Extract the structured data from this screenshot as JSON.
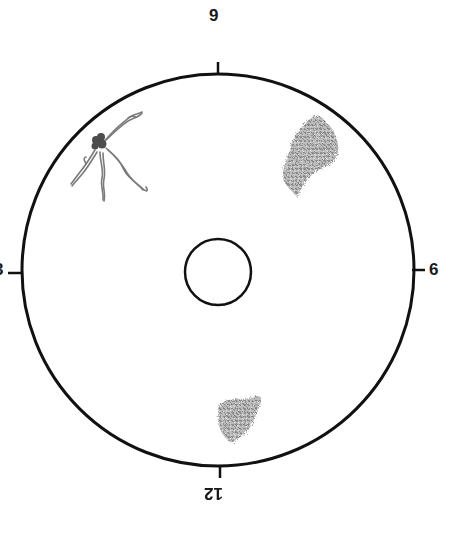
{
  "diagram": {
    "type": "clock-position plate diagram",
    "colors": {
      "outline": "#111111",
      "colony_dark": "#555555",
      "colony_light": "#9a9a9a",
      "background": "#ffffff"
    },
    "plate": {
      "cx": 218,
      "cy": 270,
      "r": 196
    },
    "center_well": {
      "cx": 218,
      "cy": 272,
      "r": 33
    },
    "labels": {
      "top": "9",
      "right": "6",
      "bottom": "12",
      "left": "3"
    },
    "colonies": [
      {
        "name": "filamentous-colony",
        "position": "upper-left",
        "cx": 100,
        "cy": 145
      },
      {
        "name": "large-fuzzy-colony",
        "position": "upper-right",
        "cx": 308,
        "cy": 155
      },
      {
        "name": "small-fuzzy-colony",
        "position": "bottom",
        "cx": 240,
        "cy": 418
      }
    ]
  }
}
